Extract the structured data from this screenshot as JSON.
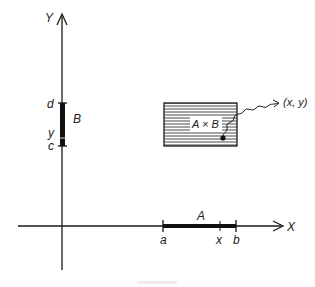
{
  "diagram": {
    "axes": {
      "x_label": "X",
      "y_label": "Y"
    },
    "segment_A": {
      "label": "A",
      "start_label": "a",
      "end_label": "b",
      "point_label": "x"
    },
    "segment_B": {
      "label": "B",
      "start_label": "c",
      "end_label": "d",
      "point_label": "y"
    },
    "product": {
      "label": "A × B",
      "point_label": "(x, y)"
    },
    "colors": {
      "ink": "#1a1a1a",
      "background": "#ffffff"
    }
  }
}
